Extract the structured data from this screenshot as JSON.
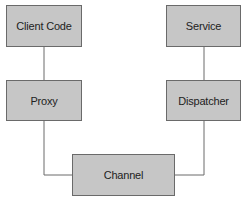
{
  "diagram": {
    "nodes": [
      {
        "id": "client",
        "label": "Client Code"
      },
      {
        "id": "proxy",
        "label": "Proxy"
      },
      {
        "id": "service",
        "label": "Service"
      },
      {
        "id": "dispatcher",
        "label": "Dispatcher"
      },
      {
        "id": "channel",
        "label": "Channel"
      }
    ],
    "edges": [
      {
        "from": "client",
        "to": "proxy"
      },
      {
        "from": "proxy",
        "to": "channel"
      },
      {
        "from": "channel",
        "to": "dispatcher"
      },
      {
        "from": "dispatcher",
        "to": "service"
      }
    ],
    "colors": {
      "box_fill": "#c6c6c6",
      "box_border": "#6a6a6a",
      "line": "#6a6a6a"
    }
  }
}
